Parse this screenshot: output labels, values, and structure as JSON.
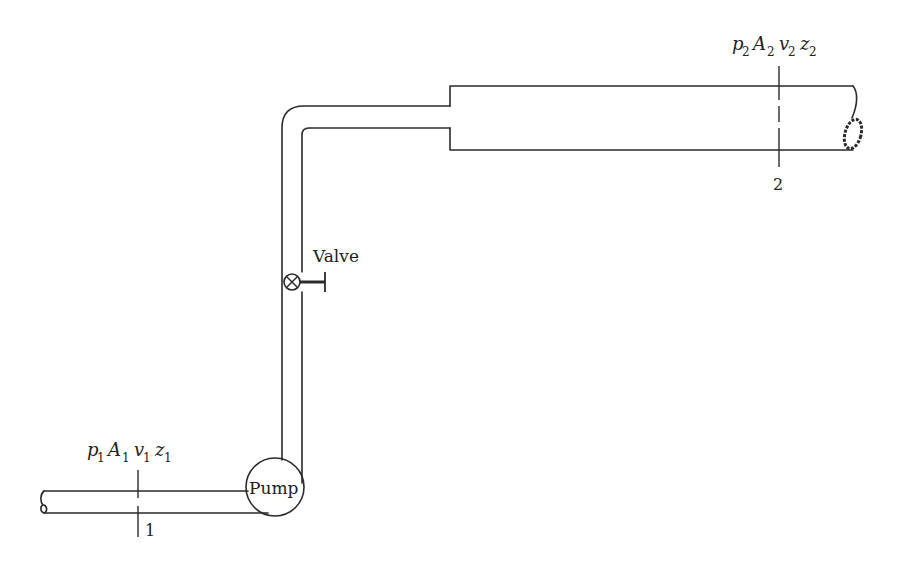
{
  "diagram": {
    "labels": {
      "pump": "Pump",
      "valve": "Valve",
      "section1_number": "1",
      "section2_number": "2",
      "section1_vars": [
        {
          "sym": "p",
          "sub": "1"
        },
        {
          "sym": "A",
          "sub": "1"
        },
        {
          "sym": "v",
          "sub": "1"
        },
        {
          "sym": "z",
          "sub": "1"
        }
      ],
      "section2_vars": [
        {
          "sym": "p",
          "sub": "2"
        },
        {
          "sym": "A",
          "sub": "2"
        },
        {
          "sym": "v",
          "sub": "2"
        },
        {
          "sym": "z",
          "sub": "2"
        }
      ]
    },
    "components": [
      "inlet-pipe",
      "pump",
      "vertical-riser",
      "valve",
      "elbow",
      "sudden-expansion",
      "outlet-pipe"
    ],
    "colors": {
      "line": "#2a2a2a",
      "background": "#ffffff"
    }
  }
}
